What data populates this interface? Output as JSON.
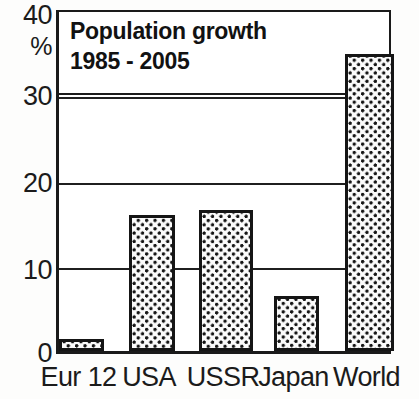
{
  "chart_data": {
    "type": "bar",
    "title": "Population growth",
    "title_line1": "Population growth",
    "title_line2": "1985 - 2005",
    "subtitle": "1985 - 2005",
    "categories": [
      "Eur 12",
      "USA",
      "USSR",
      "Japan",
      "World"
    ],
    "values": [
      1.4,
      16.0,
      16.6,
      6.4,
      34.8
    ],
    "xlabel": "",
    "ylabel": "%",
    "ylim": [
      0,
      40
    ],
    "yticks": [
      0,
      10,
      20,
      30,
      40
    ],
    "ytick_labels": [
      "0",
      "10",
      "20",
      "30",
      "40"
    ],
    "gridlines": [
      10,
      20,
      30
    ],
    "grid": true,
    "legend": null,
    "legend_position": "none",
    "series": [
      {
        "name": "Population growth 1985 - 2005",
        "values": [
          1.4,
          16.0,
          16.6,
          6.4,
          34.8
        ]
      }
    ],
    "unit": "%",
    "colors": {
      "bar_fill": "#fbfbfb",
      "bar_pattern": "#141414",
      "bar_border": "#151515",
      "axis": "#1a1a1a",
      "grid": "#1f1f1f",
      "text": "#1b1b1b",
      "background": "#ffffff"
    }
  },
  "axis": {
    "y": {
      "unit_label": "%",
      "ticks": [
        {
          "label": "40",
          "value": 40
        },
        {
          "label": "30",
          "value": 30
        },
        {
          "label": "20",
          "value": 20
        },
        {
          "label": "10",
          "value": 10
        },
        {
          "label": "0",
          "value": 0
        }
      ]
    },
    "x": {
      "ticks": [
        {
          "label": "Eur 12"
        },
        {
          "label": "USA"
        },
        {
          "label": "USSR"
        },
        {
          "label": "Japan"
        },
        {
          "label": "World"
        }
      ]
    }
  }
}
